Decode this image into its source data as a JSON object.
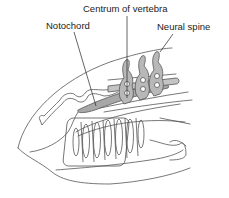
{
  "figure": {
    "labels": {
      "centrum": "Centrum of vertebra",
      "notochord": "Notochord",
      "neural_spine": "Neural spine"
    },
    "colors": {
      "outline": "#555555",
      "vertebra_fill": "#b8b8b8",
      "notochord_fill": "#a8a8a8",
      "text": "#222222",
      "background": "#ffffff"
    }
  }
}
